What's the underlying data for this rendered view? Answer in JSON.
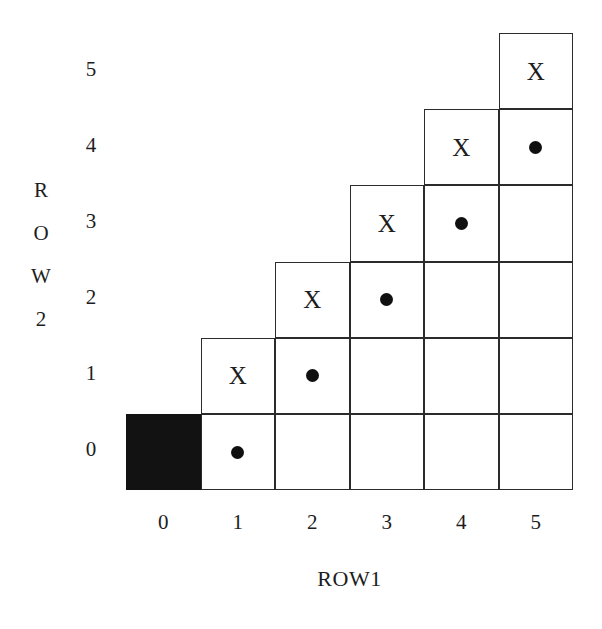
{
  "figure": {
    "background_color": "#ffffff",
    "line_color": "#2b2b2b",
    "fill_color": "#121212",
    "text_color": "#1d1d1d"
  },
  "axes": {
    "x": {
      "title": "ROW1",
      "ticks": [
        "0",
        "1",
        "2",
        "3",
        "4",
        "5"
      ]
    },
    "y": {
      "title": "ROW2",
      "title_letters": [
        "R",
        "O",
        "W",
        "2"
      ],
      "ticks": [
        "5",
        "4",
        "3",
        "2",
        "1",
        "0"
      ]
    }
  },
  "marks": {
    "cross": "X",
    "dot": "●",
    "filled": ""
  },
  "chart_data": {
    "type": "heatmap",
    "title": "",
    "subtitle": "",
    "xlabel": "ROW1",
    "ylabel": "ROW2",
    "xlim": [
      0,
      5
    ],
    "ylim": [
      0,
      5
    ],
    "x_ticks": [
      0,
      1,
      2,
      3,
      4,
      5
    ],
    "y_ticks": [
      0,
      1,
      2,
      3,
      4,
      5
    ],
    "grid": true,
    "legend": "none",
    "categories": [
      "0",
      "1",
      "2",
      "3",
      "4",
      "5"
    ],
    "cells": [
      {
        "col": 0,
        "row": 0,
        "mark": "filled"
      },
      {
        "col": 1,
        "row": 0,
        "mark": "dot"
      },
      {
        "col": 2,
        "row": 0,
        "mark": "none"
      },
      {
        "col": 3,
        "row": 0,
        "mark": "none"
      },
      {
        "col": 4,
        "row": 0,
        "mark": "none"
      },
      {
        "col": 5,
        "row": 0,
        "mark": "none"
      },
      {
        "col": 1,
        "row": 1,
        "mark": "cross"
      },
      {
        "col": 2,
        "row": 1,
        "mark": "dot"
      },
      {
        "col": 3,
        "row": 1,
        "mark": "none"
      },
      {
        "col": 4,
        "row": 1,
        "mark": "none"
      },
      {
        "col": 5,
        "row": 1,
        "mark": "none"
      },
      {
        "col": 2,
        "row": 2,
        "mark": "cross"
      },
      {
        "col": 3,
        "row": 2,
        "mark": "dot"
      },
      {
        "col": 4,
        "row": 2,
        "mark": "none"
      },
      {
        "col": 5,
        "row": 2,
        "mark": "none"
      },
      {
        "col": 3,
        "row": 3,
        "mark": "cross"
      },
      {
        "col": 4,
        "row": 3,
        "mark": "dot"
      },
      {
        "col": 5,
        "row": 3,
        "mark": "none"
      },
      {
        "col": 4,
        "row": 4,
        "mark": "cross"
      },
      {
        "col": 5,
        "row": 4,
        "mark": "dot"
      },
      {
        "col": 5,
        "row": 5,
        "mark": "cross"
      }
    ]
  }
}
